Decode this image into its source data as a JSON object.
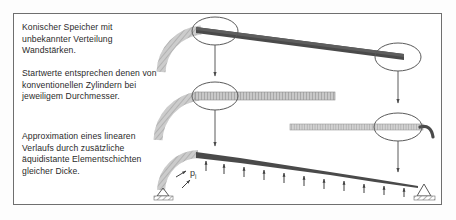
{
  "figure": {
    "kind": "technical-diagram",
    "language": "de",
    "border_color": "#6f6f6f",
    "background": "#ffffff"
  },
  "annotations": [
    {
      "id": "conical-vessel",
      "text": "Konischer Speicher mit unbekannter Verteilung Wandstärken."
    },
    {
      "id": "start-values",
      "text": "Startwerte entsprechen denen von konventionellen Zylindern bei jeweiligem Durchmesser."
    },
    {
      "id": "linear-approximation",
      "text": "Approximation eines linearen Verlaufs durch zusätzliche äquidistante Elementschichten gleicher Dicke."
    }
  ],
  "labels": {
    "pressure_symbol": "p",
    "pressure_subscript": "i"
  },
  "colors": {
    "dark_wall": "#4a4a4a",
    "hatch_gray": "#9a9a9a",
    "light_hatch": "#b9b9b9",
    "line": "#5a5a5a",
    "text": "#2a2a2a"
  },
  "stages": [
    {
      "id": "stage-1-conical",
      "caption_ref": "conical-vessel",
      "wall_style": "tapered-solid-dark",
      "detail_circle": true,
      "arc_hatched": true
    },
    {
      "id": "stage-2-cylindrical",
      "caption_ref": "start-values",
      "wall_style": "uniform-hatched",
      "detail_circle": true,
      "arc_hatched": true,
      "bars": 2
    },
    {
      "id": "stage-3-layered",
      "caption_ref": "linear-approximation",
      "wall_style": "stepped-tapered",
      "load_arrows": 12,
      "supports": [
        "pin-left",
        "pin-right"
      ]
    }
  ]
}
